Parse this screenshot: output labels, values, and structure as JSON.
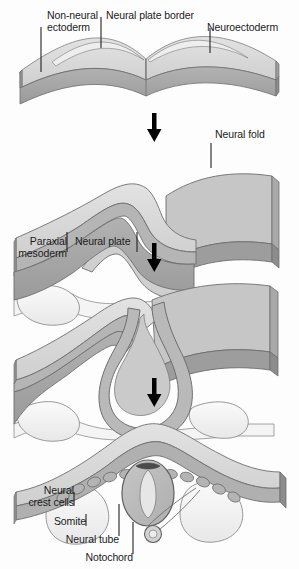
{
  "figure": {
    "background_color": "#fdfdfd",
    "palette": {
      "ectoderm_top": "#d8d8d8",
      "neural_plate_top": "#e9e9e9",
      "slab_side": "#a8a8a8",
      "slab_edge_dark": "#8c8c8c",
      "neuroectoderm_band": "#bdbdbd",
      "mesoderm_fill": "#f2f2f2",
      "somite_fill": "#efefef",
      "crest_cell_fill": "#b9b9b9",
      "neural_tube_fill": "#bcbcbc",
      "lumen_fill": "#e4e4e4",
      "notochord_fill": "#d2d2d2",
      "outline": "#6e6e6e",
      "arrow_color": "#000000",
      "leader_line": "#222222",
      "text_color": "#1b1b1b"
    }
  },
  "panels": [
    {
      "id": "stage-1-neural-plate",
      "stage_number": 1,
      "labels": [
        {
          "id": "non-neural-ectoderm",
          "text": "Non-neural\nectoderm"
        },
        {
          "id": "neural-plate-border",
          "text": "Neural plate border"
        },
        {
          "id": "neuroectoderm",
          "text": "Neuroectoderm"
        }
      ]
    },
    {
      "id": "stage-2-neural-fold",
      "stage_number": 2,
      "labels": [
        {
          "id": "neural-fold",
          "text": "Neural fold"
        },
        {
          "id": "paraxial-mesoderm",
          "text": "Paraxial\nmesoderm"
        },
        {
          "id": "neural-plate",
          "text": "Neural plate"
        }
      ]
    },
    {
      "id": "stage-3-neural-groove",
      "stage_number": 3,
      "labels": []
    },
    {
      "id": "stage-4-neural-tube",
      "stage_number": 4,
      "labels": [
        {
          "id": "neural-crest-cells",
          "text": "Neural\ncrest cells"
        },
        {
          "id": "somite",
          "text": "Somite"
        },
        {
          "id": "neural-tube",
          "text": "Neural tube"
        },
        {
          "id": "notochord",
          "text": "Notochord"
        }
      ]
    }
  ],
  "arrows": [
    {
      "id": "arrow-stage-1-to-2"
    },
    {
      "id": "arrow-stage-2-to-3"
    },
    {
      "id": "arrow-stage-3-to-4"
    }
  ]
}
